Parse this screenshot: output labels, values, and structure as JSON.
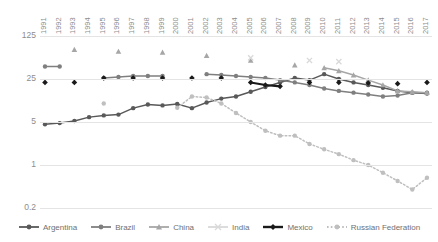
{
  "chart_data": {
    "type": "line",
    "title": "",
    "xlabel": "",
    "ylabel": "",
    "yscale": "log",
    "ylim": [
      0.2,
      125
    ],
    "yticks": [
      125,
      25,
      5,
      1,
      0.2
    ],
    "ytick_labels": [
      "125",
      "25",
      "5",
      "1",
      "0.2"
    ],
    "grid": true,
    "legend_position": "bottom",
    "x": [
      1991,
      1992,
      1993,
      1994,
      1995,
      1996,
      1997,
      1998,
      1999,
      2000,
      2001,
      2002,
      2003,
      2004,
      2005,
      2006,
      2007,
      2008,
      2009,
      2010,
      2011,
      2012,
      2013,
      2014,
      2015,
      2016,
      2017
    ],
    "xtick_labels": [
      "1991",
      "1992",
      "1993",
      "1994",
      "1995",
      "1996",
      "1997",
      "1998",
      "1999",
      "2000",
      "2001",
      "2002",
      "2003",
      "2004",
      "2005",
      "2006",
      "2007",
      "2008",
      "2009",
      "2010",
      "2011",
      "2012",
      "2013",
      "2014",
      "2015",
      "2016",
      "2017"
    ],
    "series": [
      {
        "name": "Argentina",
        "color": "#595959",
        "marker": "circle",
        "dash": "solid",
        "values": [
          4.6,
          4.8,
          5.2,
          6.0,
          6.4,
          6.6,
          8.4,
          9.6,
          9.3,
          9.8,
          8.4,
          10.4,
          12.0,
          13.0,
          15.5,
          18.5,
          22.0,
          26.0,
          24.0,
          30.0,
          25.0,
          22.0,
          20.0,
          18.0,
          16.0,
          15.0,
          14.5
        ]
      },
      {
        "name": "Brazil",
        "color": "#7f7f7f",
        "marker": "circle",
        "dash": "solid",
        "values": [
          40.0,
          40.0,
          null,
          null,
          26.0,
          27.0,
          28.0,
          28.0,
          28.0,
          null,
          null,
          30.0,
          29.0,
          28.0,
          27.0,
          26.0,
          24.0,
          22.0,
          20.0,
          17.5,
          16.0,
          15.0,
          14.0,
          13.0,
          13.5,
          15.0,
          15.0
        ]
      },
      {
        "name": "China",
        "color": "#a6a6a6",
        "marker": "triangle",
        "dash": "solid",
        "values": [
          null,
          null,
          75.0,
          null,
          null,
          70.0,
          null,
          null,
          68.0,
          null,
          null,
          60.0,
          null,
          null,
          50.0,
          null,
          null,
          42.0,
          null,
          38.0,
          34.0,
          29.0,
          24.0,
          20.0,
          16.0,
          15.5,
          15.0
        ]
      },
      {
        "name": "India",
        "color": "#d9d9d9",
        "marker": "cross",
        "dash": "solid",
        "values": [
          null,
          null,
          null,
          null,
          null,
          null,
          null,
          null,
          null,
          null,
          null,
          null,
          null,
          null,
          55.0,
          null,
          null,
          null,
          50.0,
          null,
          48.0,
          null,
          null,
          null,
          null,
          null,
          null
        ]
      },
      {
        "name": "Mexico",
        "color": "#1a1a1a",
        "marker": "diamond",
        "dash": "solid",
        "values": [
          22.0,
          null,
          22.0,
          null,
          26.0,
          null,
          26.0,
          null,
          26.0,
          null,
          26.0,
          null,
          26.0,
          null,
          22.0,
          20.0,
          19.0,
          null,
          22.0,
          null,
          22.0,
          null,
          21.5,
          null,
          21.0,
          null,
          22.0
        ]
      },
      {
        "name": "Russian Federation",
        "color": "#bfbfbf",
        "marker": "circle",
        "dash": "dotted",
        "values": [
          null,
          null,
          null,
          null,
          10.0,
          null,
          null,
          null,
          null,
          8.5,
          13.0,
          12.5,
          10.0,
          7.0,
          5.0,
          3.6,
          3.0,
          3.0,
          2.2,
          1.8,
          1.5,
          1.2,
          1.0,
          0.75,
          0.55,
          0.4,
          0.62
        ]
      }
    ]
  },
  "legend": {
    "items": [
      {
        "label": "Argentina"
      },
      {
        "label": "Brazil"
      },
      {
        "label": "China"
      },
      {
        "label": "India"
      },
      {
        "label": "Mexico"
      },
      {
        "label": "Russian Federation"
      }
    ]
  }
}
